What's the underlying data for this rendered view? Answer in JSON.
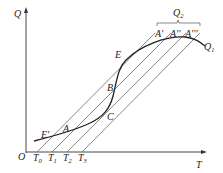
{
  "diagram": {
    "axes": {
      "y_label": "Q",
      "x_label": "T",
      "origin_label": "O"
    },
    "x_ticks": [
      {
        "base": "T",
        "sub": "0"
      },
      {
        "base": "T",
        "sub": "1"
      },
      {
        "base": "T",
        "sub": "2"
      },
      {
        "base": "T",
        "sub": "3"
      }
    ],
    "curve": {
      "label_base": "Q",
      "label_sub": "1",
      "description": "S-shaped heat generation curve"
    },
    "parallel_lines_label": {
      "base": "Q",
      "sub": "2",
      "description": "Family of straight heat-removal lines starting at T0..T3"
    },
    "points": {
      "E_prime": "E'",
      "A": "A",
      "C": "C",
      "B": "B",
      "E": "E",
      "A_prime": "A'",
      "A_double_prime": "A''",
      "A_triple_prime": "A'''"
    },
    "colors": {
      "axis": "#333333",
      "curve": "#222222",
      "lines": "#555555",
      "text": "#222222"
    }
  }
}
